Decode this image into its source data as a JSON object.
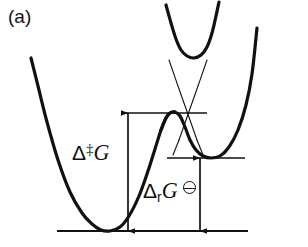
{
  "figure": {
    "panel_label": "(a)",
    "type": "free-energy-reaction-coordinate-diagram",
    "background_color": "#ffffff",
    "curve_color": "#111111",
    "text_color": "#111111"
  },
  "labels": {
    "activation": {
      "delta": "Δ",
      "superscript": "‡",
      "quantity": "G",
      "full_text": "Δ‡G",
      "meaning": "standard-activation-free-energy"
    },
    "reaction": {
      "delta": "Δ",
      "subscript": "r",
      "quantity": "G",
      "standard_state_symbol": "⦵",
      "full_text": "ΔrG⦵",
      "meaning": "standard-reaction-free-energy"
    }
  },
  "chart_data": {
    "type": "line",
    "title": "",
    "xlabel": "",
    "ylabel": "",
    "grid": false,
    "legend": false,
    "axis_visible": false,
    "series": [
      {
        "name": "reactant-well-adiabatic-branch",
        "style": "thick-solid",
        "width": 3.2,
        "points": [
          [
            31,
            58
          ],
          [
            38,
            86
          ],
          [
            47,
            122
          ],
          [
            58,
            160
          ],
          [
            70,
            192
          ],
          [
            82,
            213
          ],
          [
            92,
            224
          ],
          [
            101,
            230
          ],
          [
            110,
            231
          ],
          [
            120,
            227
          ],
          [
            129,
            216
          ],
          [
            139,
            196
          ],
          [
            148,
            171
          ],
          [
            155,
            149
          ],
          [
            161,
            130
          ],
          [
            166,
            118
          ],
          [
            170,
            113
          ],
          [
            175,
            112
          ]
        ]
      },
      {
        "name": "product-well-adiabatic-branch",
        "style": "thick-solid",
        "width": 3.2,
        "points": [
          [
            161,
            130
          ],
          [
            166,
            118
          ],
          [
            170,
            113
          ],
          [
            175,
            112
          ],
          [
            180,
            116
          ],
          [
            185,
            127
          ],
          [
            190,
            140
          ],
          [
            196,
            150
          ],
          [
            203,
            156
          ],
          [
            211,
            158
          ],
          [
            220,
            156
          ],
          [
            229,
            147
          ],
          [
            238,
            130
          ],
          [
            246,
            105
          ],
          [
            252,
            74
          ],
          [
            257,
            28
          ]
        ]
      },
      {
        "name": "upper-excited-state-parabola",
        "style": "thick-solid",
        "width": 3.2,
        "points": [
          [
            166,
            5
          ],
          [
            171,
            23
          ],
          [
            176,
            39
          ],
          [
            181,
            50
          ],
          [
            187,
            56
          ],
          [
            194,
            58
          ],
          [
            201,
            55
          ],
          [
            207,
            47
          ],
          [
            212,
            33
          ],
          [
            216,
            16
          ],
          [
            219,
            2
          ]
        ]
      },
      {
        "name": "diabatic-line-reactant",
        "style": "thin-solid",
        "width": 1.1,
        "points": [
          [
            169,
            60
          ],
          [
            178,
            86
          ],
          [
            190,
            120
          ],
          [
            197,
            140
          ]
        ]
      },
      {
        "name": "diabatic-line-product",
        "style": "thin-solid",
        "width": 1.1,
        "points": [
          [
            207,
            60
          ],
          [
            198,
            86
          ],
          [
            186,
            120
          ],
          [
            179,
            140
          ]
        ]
      },
      {
        "name": "diabatic-line-reactant-lower",
        "style": "thin-solid",
        "width": 1.1,
        "points": [
          [
            197,
            140
          ],
          [
            203,
            155
          ]
        ]
      },
      {
        "name": "diabatic-line-product-lower",
        "style": "thin-solid",
        "width": 1.1,
        "points": [
          [
            179,
            140
          ],
          [
            173,
            155
          ]
        ]
      }
    ],
    "level_lines": [
      {
        "name": "transition-state-level",
        "y": 113,
        "x_start": 122,
        "x_end": 207,
        "width": 1.3
      },
      {
        "name": "product-well-level",
        "y": 158,
        "x_start": 167,
        "x_end": 245,
        "width": 1.6
      },
      {
        "name": "reactant-well-baseline",
        "y": 231,
        "x_start": 57,
        "x_end": 248,
        "width": 1.8
      }
    ],
    "measurement_arrows": [
      {
        "name": "activation-energy-arrow",
        "label": "Δ‡G",
        "x": 128,
        "y_top": 113,
        "y_bottom": 231,
        "double_headed": true
      },
      {
        "name": "reaction-energy-arrow",
        "label": "ΔrG⦵",
        "x": 200,
        "y_top": 158,
        "y_bottom": 231,
        "double_headed": true
      }
    ]
  }
}
